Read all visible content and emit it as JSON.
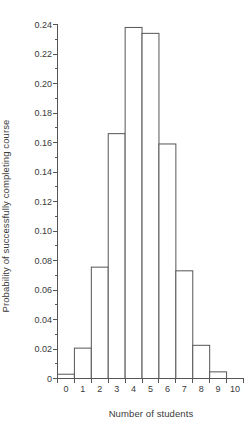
{
  "chart_data": {
    "type": "bar",
    "title": "",
    "subtitle": "",
    "xlabel": "Number of students",
    "ylabel": "Probability of successfully completing course",
    "categories": [
      0,
      1,
      2,
      3,
      4,
      5,
      6,
      7,
      8,
      9,
      10
    ],
    "values": [
      0.0029,
      0.0206,
      0.0755,
      0.166,
      0.238,
      0.234,
      0.159,
      0.073,
      0.0225,
      0.0045,
      0.0
    ],
    "xlim": [
      -0.5,
      10.5
    ],
    "ylim": [
      0,
      0.24
    ],
    "xticks": [
      0,
      1,
      2,
      3,
      4,
      5,
      6,
      7,
      8,
      9,
      10
    ],
    "xtick_labels": [
      "0",
      "1",
      "2",
      "3",
      "4",
      "5",
      "6",
      "7",
      "8",
      "9",
      "10"
    ],
    "yticks": [
      0,
      0.02,
      0.04,
      0.06,
      0.08,
      0.1,
      0.12,
      0.14,
      0.16,
      0.18,
      0.2,
      0.22,
      0.24
    ],
    "ytick_labels": [
      "0",
      "0.02",
      "0.04",
      "0.06",
      "0.08",
      "0.10",
      "0.12",
      "0.14",
      "0.16",
      "0.18",
      "0.20",
      "0.22",
      "0.24"
    ],
    "grid": false,
    "legend": false,
    "legend_position": "none",
    "bar_fill_color": "#ffffff",
    "bar_edge_color": "#555555",
    "axis_color": "#555555",
    "text_color": "#3a3a3a",
    "bin_width": 1,
    "tick_direction": "out"
  }
}
